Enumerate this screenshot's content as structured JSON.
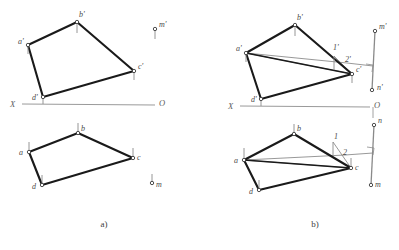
{
  "figure": {
    "type": "descriptive-geometry-orthographic-projection",
    "background_color": "#ffffff",
    "thick_line_color": "#1a1a1a",
    "thin_line_color": "#8a8a8a",
    "axis_line_color": "#9a9a9a",
    "label_color": "#4a4a4a",
    "captions": [
      {
        "text": "a)",
        "x": 104,
        "y": 227
      },
      {
        "text": "b)",
        "x": 315,
        "y": 227
      }
    ]
  },
  "panel_a": {
    "caption": "a)",
    "axis": {
      "label_left": "X",
      "label_right": "O",
      "x1": 22,
      "y1": 104,
      "x2": 155,
      "y2": 105,
      "label_left_x": 10,
      "label_left_y": 107,
      "label_right_x": 159,
      "label_right_y": 106
    },
    "frontal_projection": {
      "name": "quadrilateral-a-b-c-d-frontal",
      "vertices": [
        {
          "id": "a_prime",
          "label": "a'",
          "x": 28,
          "y": 45,
          "lx": 18,
          "ly": 44,
          "tick_dy": 9
        },
        {
          "id": "b_prime",
          "label": "b'",
          "x": 77,
          "y": 22,
          "lx": 79,
          "ly": 17,
          "tick_dy": 11
        },
        {
          "id": "c_prime",
          "label": "c'",
          "x": 134,
          "y": 71,
          "lx": 138,
          "ly": 69,
          "tick_dy": 9
        },
        {
          "id": "d_prime",
          "label": "d'",
          "x": 43,
          "y": 97,
          "lx": 32,
          "ly": 100,
          "tick_dy": 7
        }
      ]
    },
    "horizontal_projection": {
      "name": "quadrilateral-a-b-c-d-horizontal",
      "vertices": [
        {
          "id": "a",
          "label": "a",
          "x": 29,
          "y": 152,
          "lx": 19,
          "ly": 155,
          "tick_dy": -10
        },
        {
          "id": "b",
          "label": "b",
          "x": 78,
          "y": 133,
          "lx": 81,
          "ly": 131,
          "tick_dy": -10
        },
        {
          "id": "c",
          "label": "c",
          "x": 133,
          "y": 158,
          "lx": 137,
          "ly": 160,
          "tick_dy": -10
        },
        {
          "id": "d",
          "label": "d",
          "x": 42,
          "y": 185,
          "lx": 32,
          "ly": 189,
          "tick_dy": -10
        }
      ]
    },
    "point_m": {
      "frontal": {
        "id": "m_prime",
        "label": "m'",
        "x": 155,
        "y": 29,
        "lx": 159,
        "ly": 27,
        "tick_dy": 10
      },
      "horizontal": {
        "id": "m",
        "label": "m",
        "x": 152,
        "y": 183,
        "lx": 156,
        "ly": 187,
        "tick_dy": -9
      }
    }
  },
  "panel_b": {
    "caption": "b)",
    "axis": {
      "label_left": "X",
      "label_right": "O",
      "x1": 240,
      "y1": 106,
      "x2": 370,
      "y2": 107,
      "label_left_x": 228,
      "label_left_y": 109,
      "label_right_x": 374,
      "label_right_y": 108
    },
    "frontal_projection": {
      "name": "quadrilateral-a-b-c-d-frontal",
      "vertices": [
        {
          "id": "a_prime",
          "label": "a'",
          "x": 246,
          "y": 53,
          "lx": 236,
          "ly": 51,
          "tick_dy": 9
        },
        {
          "id": "b_prime",
          "label": "b'",
          "x": 295,
          "y": 25,
          "lx": 297,
          "ly": 20,
          "tick_dy": 11
        },
        {
          "id": "c_prime",
          "label": "c'",
          "x": 352,
          "y": 74,
          "lx": 356,
          "ly": 72,
          "tick_dy": 9
        },
        {
          "id": "d_prime",
          "label": "d'",
          "x": 261,
          "y": 99,
          "lx": 251,
          "ly": 102,
          "tick_dy": 7
        }
      ]
    },
    "horizontal_projection": {
      "name": "quadrilateral-a-b-c-d-horizontal",
      "vertices": [
        {
          "id": "a",
          "label": "a",
          "x": 244,
          "y": 160,
          "lx": 234,
          "ly": 163,
          "tick_dy": -12
        },
        {
          "id": "b",
          "label": "b",
          "x": 294,
          "y": 134,
          "lx": 297,
          "ly": 131,
          "tick_dy": -10
        },
        {
          "id": "c",
          "label": "c",
          "x": 351,
          "y": 168,
          "lx": 355,
          "ly": 170,
          "tick_dy": -10
        },
        {
          "id": "d",
          "label": "d",
          "x": 259,
          "y": 190,
          "lx": 249,
          "ly": 194,
          "tick_dy": -10
        }
      ]
    },
    "auxiliary_points": {
      "frontal": [
        {
          "id": "one_prime",
          "label": "1'",
          "x": 334,
          "y": 56,
          "lx": 333,
          "ly": 50,
          "tick_dy": 14
        },
        {
          "id": "two_prime",
          "label": "2'",
          "x": 347,
          "y": 63,
          "lx": 345,
          "ly": 62
        }
      ],
      "horizontal": [
        {
          "id": "one",
          "label": "1",
          "x": 333,
          "y": 142,
          "lx": 334,
          "ly": 139,
          "tick_dy": 13
        },
        {
          "id": "two",
          "label": "2",
          "x": 345,
          "y": 155,
          "lx": 343,
          "ly": 155
        }
      ]
    },
    "point_mn_frontal": {
      "m_prime": {
        "label": "m'",
        "x": 375,
        "y": 31,
        "lx": 379,
        "ly": 29
      },
      "n_prime": {
        "label": "n'",
        "x": 372,
        "y": 90,
        "lx": 377,
        "ly": 90
      },
      "perpendicular_foot": {
        "x": 373,
        "y": 66
      },
      "right_angle_marker": true
    },
    "point_mn_horizontal": {
      "n": {
        "label": "n",
        "x": 374,
        "y": 125,
        "lx": 378,
        "ly": 123
      },
      "m": {
        "label": "m",
        "x": 371,
        "y": 185,
        "lx": 375,
        "ly": 187
      },
      "perpendicular_foot": {
        "x": 373,
        "y": 153
      },
      "right_angle_marker": true
    }
  }
}
